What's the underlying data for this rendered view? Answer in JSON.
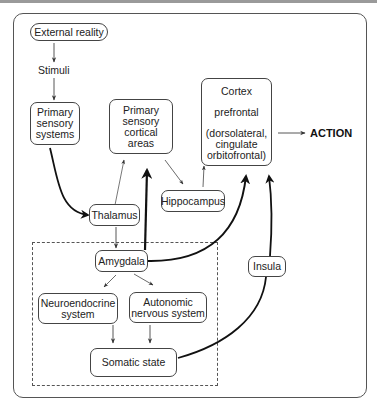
{
  "diagram": {
    "nodes": {
      "external_reality": "External reality",
      "stimuli": "Stimuli",
      "primary_sensory_systems": "Primary\nsensory\nsystems",
      "primary_sensory_cortical_areas": "Primary\nsensory\ncortical\nareas",
      "cortex_title": "Cortex",
      "cortex_sub": "prefrontal",
      "cortex_detail": "(dorsolateral,\ncingulate\norbitofrontal)",
      "action": "ACTION",
      "hippocampus": "Hippocampus",
      "thalamus": "Thalamus",
      "amygdala": "Amygdala",
      "insula": "Insula",
      "neuroendocrine_system": "Neuroendocrine\nsystem",
      "autonomic_nervous_system": "Autonomic\nnervous system",
      "somatic_state": "Somatic state"
    },
    "edges": [
      {
        "from": "External reality",
        "to": "Stimuli",
        "style": "thin"
      },
      {
        "from": "Stimuli",
        "to": "Primary sensory systems",
        "style": "thin"
      },
      {
        "from": "Primary sensory systems",
        "to": "Thalamus",
        "style": "thick-curve"
      },
      {
        "from": "Thalamus",
        "to": "Primary sensory cortical areas",
        "style": "thin"
      },
      {
        "from": "Thalamus",
        "to": "Amygdala",
        "style": "thin"
      },
      {
        "from": "Primary sensory cortical areas",
        "to": "Hippocampus",
        "style": "thin"
      },
      {
        "from": "Hippocampus",
        "to": "Cortex",
        "style": "thin"
      },
      {
        "from": "Amygdala",
        "to": "Primary sensory cortical areas",
        "style": "thick"
      },
      {
        "from": "Amygdala",
        "to": "Cortex",
        "style": "thick-curve"
      },
      {
        "from": "Amygdala",
        "to": "Neuroendocrine system",
        "style": "thin"
      },
      {
        "from": "Amygdala",
        "to": "Autonomic nervous system",
        "style": "thin"
      },
      {
        "from": "Neuroendocrine system",
        "to": "Somatic state",
        "style": "thin"
      },
      {
        "from": "Autonomic nervous system",
        "to": "Somatic state",
        "style": "thin"
      },
      {
        "from": "Somatic state",
        "to": "Cortex",
        "via": "Insula",
        "style": "thick-curve"
      },
      {
        "from": "Cortex",
        "to": "ACTION",
        "style": "thin"
      }
    ]
  }
}
